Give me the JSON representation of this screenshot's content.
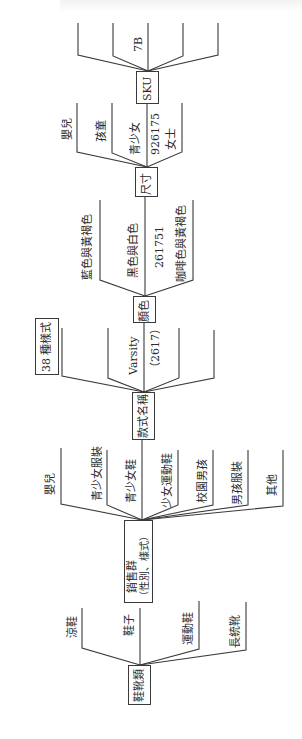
{
  "diagram": {
    "orientation": "rotated-90-ccw",
    "levels": [
      {
        "node": "鞋靴類",
        "children": [
          "涼鞋",
          "鞋子",
          "運動鞋",
          "長統靴"
        ]
      },
      {
        "node": "銷售群",
        "node_sub": "（性別、樣式）",
        "children": [
          "嬰兒",
          "青少女服裝",
          "青少女鞋",
          "少女運動鞋",
          "校園男孩",
          "男孩服裝",
          "其他"
        ]
      },
      {
        "node": "款式名稱",
        "children": [
          "",
          "",
          "Varsity",
          "（2617）",
          "",
          ""
        ],
        "side_box": "38 種樣式"
      },
      {
        "node": "顏色",
        "children": [
          "藍色與黃褐色",
          "黑色與白色",
          "261751",
          "咖啡色與黃褐色"
        ]
      },
      {
        "node": "尺寸",
        "children": [
          "嬰兒",
          "孩童",
          "青少女",
          "926175",
          "女士"
        ]
      },
      {
        "node": "SKU",
        "children": [
          "",
          "",
          "7B",
          "",
          ""
        ]
      }
    ]
  },
  "labels": {
    "footwear": "鞋靴類",
    "sandals": "涼鞋",
    "shoes": "鞋子",
    "sneakers": "運動鞋",
    "boots": "長統靴",
    "sales_group": "銷售群",
    "sales_group_sub": "（性別、樣式）",
    "infant": "嬰兒",
    "teen_girl_apparel": "青少女服裝",
    "teen_girl_shoes": "青少女鞋",
    "girl_sneakers": "少女運動鞋",
    "campus_boy": "校園男孩",
    "boy_apparel": "男孩服裝",
    "other": "其他",
    "style_name": "款式名稱",
    "varsity": "Varsity",
    "varsity_code": "（2617）",
    "styles_38": "38 種樣式",
    "color": "顏色",
    "blue_tan": "藍色與黃褐色",
    "black_white": "黑色與白色",
    "color_code": "261751",
    "brown_tan": "咖啡色與黃褐色",
    "size": "尺寸",
    "size_infant": "嬰兒",
    "size_child": "孩童",
    "size_teen_girl": "青少女",
    "size_code": "926175",
    "size_women": "女士",
    "sku": "SKU",
    "sku_7b": "7B"
  },
  "colors": {
    "line": "#3a3a3a",
    "text": "#2a2a2a",
    "background": "#ffffff"
  }
}
